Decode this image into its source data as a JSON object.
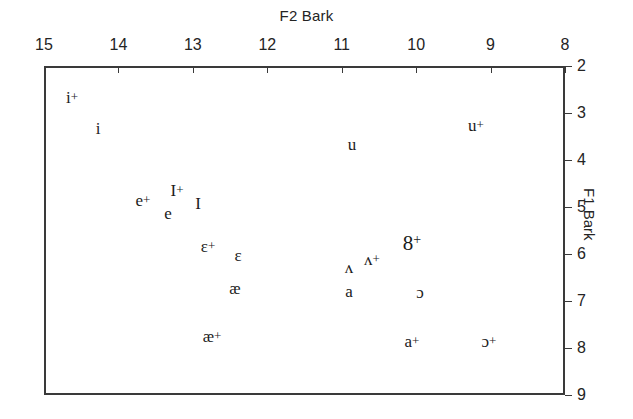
{
  "chart_data": {
    "type": "scatter",
    "title": "F2 Bark",
    "xlabel": "F2 Bark",
    "ylabel": "F1 Bark",
    "xlim": [
      15,
      8
    ],
    "ylim": [
      2,
      9
    ],
    "x_ticks": [
      15,
      14,
      13,
      12,
      11,
      10,
      9,
      8
    ],
    "y_ticks": [
      2,
      3,
      4,
      5,
      6,
      7,
      8,
      9
    ],
    "x_axis_position": "top",
    "y_axis_position": "right",
    "x_inverted": true,
    "y_inverted": true,
    "grid": false,
    "legend": null,
    "points": [
      {
        "label": "i+",
        "mark": "i",
        "plus": "+",
        "x": 14.62,
        "y": 2.66,
        "px": 72,
        "py": 97
      },
      {
        "label": "i",
        "mark": "i",
        "plus": "",
        "x": 14.27,
        "y": 3.32,
        "px": 98,
        "py": 128
      },
      {
        "label": "u+",
        "mark": "u",
        "plus": "+",
        "x": 9.28,
        "y": 3.26,
        "px": 476,
        "py": 125
      },
      {
        "label": "u",
        "mark": "u",
        "plus": "",
        "x": 11.6,
        "y": 3.66,
        "px": 352,
        "py": 144
      },
      {
        "label": "I+",
        "mark": "I",
        "plus": "+",
        "x": 13.23,
        "y": 4.66,
        "px": 177,
        "py": 190
      },
      {
        "label": "e+",
        "mark": "e",
        "plus": "+",
        "x": 13.68,
        "y": 4.87,
        "px": 143,
        "py": 200
      },
      {
        "label": "I",
        "mark": "I",
        "plus": "",
        "x": 12.83,
        "y": 4.94,
        "px": 198,
        "py": 203
      },
      {
        "label": "e",
        "mark": "e",
        "plus": "",
        "x": 13.41,
        "y": 5.15,
        "px": 168,
        "py": 213
      },
      {
        "label": "ε+",
        "mark": "ɛ",
        "plus": "+",
        "x": 12.87,
        "y": 5.85,
        "px": 208,
        "py": 246
      },
      {
        "label": "ε",
        "mark": "ɛ",
        "plus": "",
        "x": 12.46,
        "y": 6.04,
        "px": 238,
        "py": 255
      },
      {
        "label": "ɘ+",
        "mark": "8",
        "plus": "+",
        "x": 9.96,
        "y": 5.79,
        "px": 412,
        "py": 243
      },
      {
        "label": "ʌ+",
        "mark": "ʌ",
        "plus": "+",
        "x": 10.51,
        "y": 6.13,
        "px": 372,
        "py": 259
      },
      {
        "label": "ʌ",
        "mark": "ʌ",
        "plus": "",
        "x": 10.83,
        "y": 6.3,
        "px": 349,
        "py": 267
      },
      {
        "label": "æ",
        "mark": "æ",
        "plus": "",
        "x": 12.5,
        "y": 6.74,
        "px": 235,
        "py": 288
      },
      {
        "label": "a",
        "mark": "a",
        "plus": "",
        "x": 10.83,
        "y": 6.81,
        "px": 349,
        "py": 291
      },
      {
        "label": "ɔ",
        "mark": "ɔ",
        "plus": "",
        "x": 9.85,
        "y": 6.83,
        "px": 420,
        "py": 292
      },
      {
        "label": "æ+",
        "mark": "æ",
        "plus": "+",
        "x": 12.82,
        "y": 7.78,
        "px": 212,
        "py": 336
      },
      {
        "label": "a+",
        "mark": "a",
        "plus": "+",
        "x": 10.0,
        "y": 7.89,
        "px": 412,
        "py": 341
      },
      {
        "label": "ɔ+",
        "mark": "ɔ",
        "plus": "+",
        "x": 8.93,
        "y": 7.89,
        "px": 489,
        "py": 341
      }
    ]
  },
  "colors": {
    "axis": "#3a3a3a",
    "text": "#242424",
    "symbol": "#1b1b1b",
    "background": "#ffffff"
  }
}
